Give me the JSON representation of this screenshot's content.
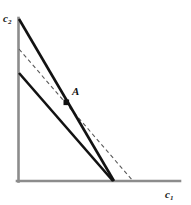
{
  "figure": {
    "background_color": "#ffffff",
    "width": 191,
    "height": 205
  },
  "axes": {
    "color": "#8c8c8c",
    "stroke_width": 2.6,
    "origin": {
      "x": 18,
      "y": 181
    },
    "y_axis": {
      "x": 18,
      "y_top": 18,
      "y_bottom": 181
    },
    "x_axis": {
      "y": 181,
      "x_left": 17,
      "x_right": 180
    },
    "x_label": "c",
    "x_label_sub": "1",
    "y_label": "c",
    "y_label_sub": "2"
  },
  "annotations": {
    "point_a_label": "A"
  },
  "chart_data": {
    "type": "line",
    "title": "",
    "xlabel": "c1",
    "ylabel": "c2",
    "grid": false,
    "legend": "none",
    "xlim": [
      0,
      191
    ],
    "ylim": [
      0,
      205
    ],
    "series": [
      {
        "name": "steep-budget-line",
        "style": "solid",
        "color": "#121212",
        "width": 2.6,
        "x": [
          19,
          114
        ],
        "y": [
          19,
          181
        ]
      },
      {
        "name": "flat-budget-line",
        "style": "solid",
        "color": "#121212",
        "width": 2.6,
        "x": [
          19,
          113
        ],
        "y": [
          73,
          181
        ]
      },
      {
        "name": "indifference-dashed-line",
        "style": "dashed",
        "color": "#5a5a5a",
        "width": 1.1,
        "dash": "4 3",
        "x": [
          19,
          133
        ],
        "y": [
          49,
          181
        ]
      }
    ],
    "points": [
      {
        "name": "A",
        "label": "A",
        "x": 66,
        "y": 102,
        "marker": "square-dot",
        "color": "#111111",
        "size": 5
      }
    ]
  }
}
